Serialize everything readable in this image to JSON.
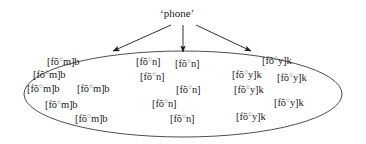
{
  "figure": {
    "root_label": "‘phone’",
    "ellipse_color": "#3a3a3a",
    "arrow_color": "#1a1a1a",
    "text_color": "#1a1a1a"
  },
  "arrows": [
    {
      "name": "arrow-to-left-cluster",
      "direction": "down-left"
    },
    {
      "name": "arrow-to-middle-cluster",
      "direction": "down"
    },
    {
      "name": "arrow-to-right-cluster",
      "direction": "down-right"
    }
  ],
  "clusters": [
    {
      "id": "left",
      "transcription_prefix": "[fõ",
      "transcription_suffix": "m]b",
      "ring": "○",
      "count": 6,
      "tokens": [
        {
          "text_prefix": "[fõ",
          "text_suffix": "m]b",
          "x": 47,
          "y": 57
        },
        {
          "text_prefix": "[fõ",
          "text_suffix": "m]b",
          "x": 33,
          "y": 70
        },
        {
          "text_prefix": "[fõ",
          "text_suffix": "m]b",
          "x": 27,
          "y": 84
        },
        {
          "text_prefix": "[fõ",
          "text_suffix": "m]b",
          "x": 77,
          "y": 84
        },
        {
          "text_prefix": "[fõ",
          "text_suffix": "m]b",
          "x": 45,
          "y": 100
        },
        {
          "text_prefix": "[fõ",
          "text_suffix": "m]b",
          "x": 75,
          "y": 114
        }
      ]
    },
    {
      "id": "middle",
      "transcription_prefix": "[fõ",
      "transcription_suffix": "n]",
      "ring": "○",
      "count": 6,
      "tokens": [
        {
          "text_prefix": "[fõ",
          "text_suffix": "n]",
          "x": 136,
          "y": 57
        },
        {
          "text_prefix": "[fõ",
          "text_suffix": "n]",
          "x": 175,
          "y": 59
        },
        {
          "text_prefix": "[fõ",
          "text_suffix": "n]",
          "x": 140,
          "y": 72
        },
        {
          "text_prefix": "[fõ",
          "text_suffix": "n]",
          "x": 176,
          "y": 85
        },
        {
          "text_prefix": "[fõ",
          "text_suffix": "n]",
          "x": 152,
          "y": 99
        },
        {
          "text_prefix": "[fõ",
          "text_suffix": "n]",
          "x": 170,
          "y": 114
        }
      ]
    },
    {
      "id": "right",
      "transcription_prefix": "[fõ",
      "transcription_suffix": "y]k",
      "ring": "○",
      "count": 6,
      "tokens": [
        {
          "text_prefix": "[fõ",
          "text_suffix": "y]k",
          "x": 262,
          "y": 56
        },
        {
          "text_prefix": "[fõ",
          "text_suffix": "y]k",
          "x": 232,
          "y": 70
        },
        {
          "text_prefix": "[fõ",
          "text_suffix": "y]k",
          "x": 277,
          "y": 73
        },
        {
          "text_prefix": "[fõ",
          "text_suffix": "y]k",
          "x": 234,
          "y": 85
        },
        {
          "text_prefix": "[fõ",
          "text_suffix": "y]k",
          "x": 274,
          "y": 98
        },
        {
          "text_prefix": "[fõ",
          "text_suffix": "y]k",
          "x": 236,
          "y": 112
        }
      ]
    }
  ]
}
